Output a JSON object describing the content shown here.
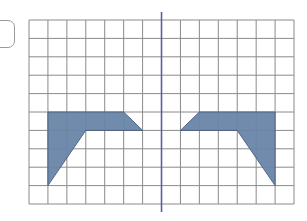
{
  "diagram": {
    "type": "reflection-on-grid",
    "grid": {
      "columns": 14,
      "rows": 10,
      "origin_px": [
        29,
        20
      ],
      "cell_w": 18.93,
      "cell_h": 18.4,
      "line_color": "#8a8a8a"
    },
    "mirror_line": {
      "column": 7,
      "color": "#5a5fa0",
      "y_top_px": 12,
      "y_bottom_px": 212
    },
    "shapes": [
      {
        "name": "original",
        "vertices": [
          [
            1,
            5
          ],
          [
            5,
            5
          ],
          [
            6,
            6
          ],
          [
            3,
            6
          ],
          [
            1,
            9
          ]
        ],
        "fill": "#6a85a8",
        "stroke": "#4a5f80"
      },
      {
        "name": "reflection",
        "vertices": [
          [
            13,
            5
          ],
          [
            9,
            5
          ],
          [
            8,
            6
          ],
          [
            11,
            6
          ],
          [
            13,
            9
          ]
        ],
        "fill": "#6a85a8",
        "stroke": "#4a5f80"
      }
    ]
  }
}
